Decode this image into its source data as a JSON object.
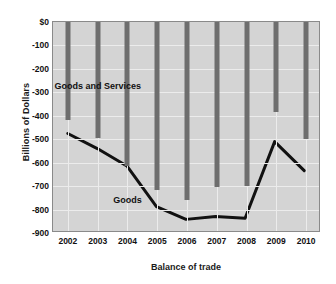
{
  "chart_data": {
    "type": "line",
    "title": "",
    "xlabel": "Balance of trade",
    "ylabel": "Billions of Dollars",
    "categories": [
      "2002",
      "2003",
      "2004",
      "2005",
      "2006",
      "2007",
      "2008",
      "2009",
      "2010"
    ],
    "ylim": [
      -900,
      0
    ],
    "yticks": [
      0,
      -100,
      -200,
      -300,
      -400,
      -500,
      -600,
      -700,
      -800,
      -900
    ],
    "ytick_labels": [
      "$0",
      "-100",
      "-200",
      "-300",
      "-400",
      "-500",
      "-600",
      "-700",
      "-800",
      "-900"
    ],
    "grid": true,
    "legend_position": "inline-annotations",
    "series": [
      {
        "name": "Goods and Services",
        "render": "bar",
        "color": "#6e6e6e",
        "values": [
          -420,
          -495,
          -615,
          -715,
          -760,
          -705,
          -700,
          -382,
          -500
        ]
      },
      {
        "name": "Goods",
        "render": "line",
        "color": "#111111",
        "values": [
          -480,
          -545,
          -620,
          -795,
          -850,
          -838,
          -845,
          -515,
          -640
        ]
      }
    ],
    "annotations": [
      {
        "text": "Goods and Services",
        "x_value": "2003",
        "y_value": -275
      },
      {
        "text": "Goods",
        "x_value": "2004",
        "y_value": -760
      }
    ]
  }
}
